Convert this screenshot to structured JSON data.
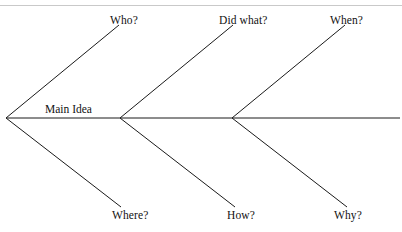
{
  "page": {
    "background_color": "#ffffff",
    "width": 402,
    "height": 232
  },
  "decorations": {
    "top_rule_color": "#c9c9c9"
  },
  "diagram": {
    "type": "fishbone",
    "line_color": "#1a1a1a",
    "center_label": "Main Idea",
    "spine": {
      "start_x": 6,
      "end_x": 400,
      "y": 118
    },
    "vertices": [
      {
        "x": 6,
        "y": 118
      },
      {
        "x": 120,
        "y": 118
      },
      {
        "x": 232,
        "y": 118
      }
    ],
    "branches": [
      {
        "id": "who",
        "label": "Who?",
        "direction": "up",
        "from_x": 6,
        "from_y": 118,
        "to_x": 119,
        "to_y": 25
      },
      {
        "id": "did-what",
        "label": "Did what?",
        "direction": "up",
        "from_x": 120,
        "from_y": 118,
        "to_x": 233,
        "to_y": 25
      },
      {
        "id": "when",
        "label": "When?",
        "direction": "up",
        "from_x": 232,
        "from_y": 118,
        "to_x": 345,
        "to_y": 25
      },
      {
        "id": "where",
        "label": "Where?",
        "direction": "down",
        "from_x": 6,
        "from_y": 118,
        "to_x": 121,
        "to_y": 207
      },
      {
        "id": "how",
        "label": "How?",
        "direction": "down",
        "from_x": 120,
        "from_y": 118,
        "to_x": 235,
        "to_y": 207
      },
      {
        "id": "why",
        "label": "Why?",
        "direction": "down",
        "from_x": 232,
        "from_y": 118,
        "to_x": 347,
        "to_y": 207
      }
    ]
  },
  "labels": {
    "who": "Who?",
    "did_what": "Did what?",
    "when": "When?",
    "where": "Where?",
    "how": "How?",
    "why": "Why?",
    "main_idea": "Main Idea"
  }
}
